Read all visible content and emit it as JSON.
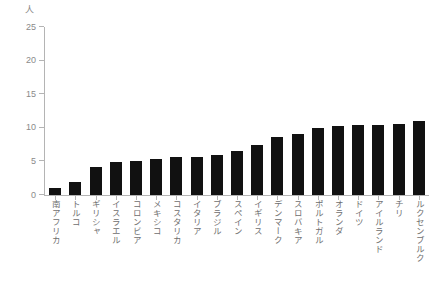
{
  "chart_data": {
    "type": "bar",
    "title": "",
    "xlabel": "",
    "ylabel": "人",
    "ylim": [
      0,
      25
    ],
    "yticks": [
      0,
      5,
      10,
      15,
      20,
      25
    ],
    "grid": false,
    "legend": false,
    "orientation": "vertical",
    "bar_color": "#111111",
    "axis_color": "#b4b4b4",
    "label_color": "#6e6e6e",
    "categories": [
      "南アフリカ",
      "トルコ",
      "ギリシャ",
      "イスラエル",
      "コロンビア",
      "メキシコ",
      "コスタリカ",
      "イタリア",
      "ブラジル",
      "スペイン",
      "イギリス",
      "デンマーク",
      "スロバキア",
      "ポルトガル",
      "オランダ",
      "ドイツ",
      "アイルランド",
      "チリ",
      "ルクセンブルク"
    ],
    "values": [
      1.0,
      2.0,
      4.2,
      4.9,
      5.0,
      5.4,
      5.6,
      5.6,
      5.9,
      6.6,
      7.4,
      8.6,
      9.1,
      9.9,
      10.2,
      10.4,
      10.4,
      10.5,
      11.0
    ]
  }
}
